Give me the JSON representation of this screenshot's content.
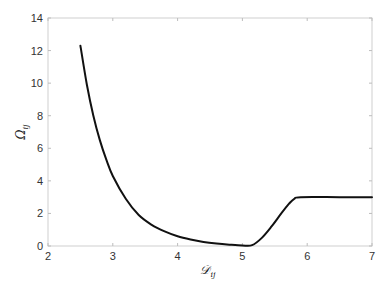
{
  "chart_data": {
    "type": "line",
    "title": "",
    "xlabel": "𝒟ij",
    "ylabel": "Ωij",
    "xlim": [
      2,
      7
    ],
    "ylim": [
      0,
      14
    ],
    "xticks": [
      2,
      3,
      4,
      5,
      6,
      7
    ],
    "yticks": [
      0,
      2,
      4,
      6,
      8,
      10,
      12,
      14
    ],
    "grid": false,
    "legend": null,
    "series": [
      {
        "name": "Ωij",
        "color": "#111111",
        "x": [
          2.5,
          2.6,
          2.7,
          2.8,
          2.9,
          3.0,
          3.2,
          3.4,
          3.6,
          3.8,
          4.0,
          4.2,
          4.4,
          4.6,
          4.8,
          5.0,
          5.15,
          5.3,
          5.45,
          5.6,
          5.72,
          5.8,
          5.9,
          6.5,
          7.0
        ],
        "y": [
          12.3,
          9.9,
          8.0,
          6.5,
          5.3,
          4.3,
          2.9,
          1.9,
          1.3,
          0.9,
          0.6,
          0.4,
          0.25,
          0.15,
          0.08,
          0.03,
          0.05,
          0.5,
          1.2,
          2.0,
          2.6,
          2.9,
          3.0,
          3.0,
          3.0
        ]
      }
    ]
  },
  "labels": {
    "x_main": "𝒟",
    "x_sub": "ij",
    "y_main": "Ω",
    "y_sub": "ij"
  }
}
